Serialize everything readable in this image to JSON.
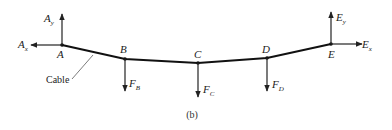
{
  "diagram": {
    "caption": "(b)",
    "cable_label": "Cable",
    "points": [
      {
        "id": "A",
        "label": "A"
      },
      {
        "id": "B",
        "label": "B"
      },
      {
        "id": "C",
        "label": "C"
      },
      {
        "id": "D",
        "label": "D"
      },
      {
        "id": "E",
        "label": "E"
      }
    ],
    "forces": [
      {
        "id": "Ay",
        "base": "A",
        "sub": "y",
        "direction": "up"
      },
      {
        "id": "Ax",
        "base": "A",
        "sub": "x",
        "direction": "left"
      },
      {
        "id": "FB",
        "base": "F",
        "sub": "B",
        "direction": "down"
      },
      {
        "id": "FC",
        "base": "F",
        "sub": "C",
        "direction": "down"
      },
      {
        "id": "FD",
        "base": "F",
        "sub": "D",
        "direction": "down"
      },
      {
        "id": "Ey",
        "base": "E",
        "sub": "y",
        "direction": "up"
      },
      {
        "id": "Ex",
        "base": "E",
        "sub": "x",
        "direction": "right"
      }
    ]
  }
}
